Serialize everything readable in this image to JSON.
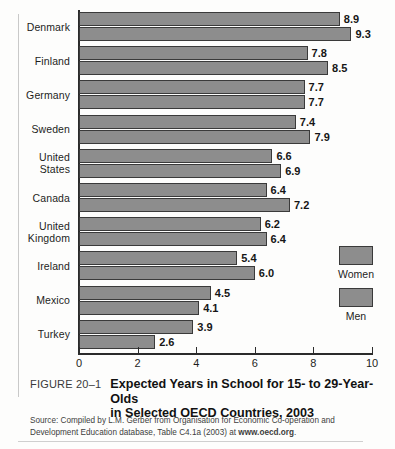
{
  "figure": {
    "number_label": "FIGURE 20–1",
    "title_line1": "Expected Years in School for 15- to 29-Year-Olds",
    "title_line2": "in Selected OECD Countries, 2003",
    "source_line1": "Source: Compiled by L.M. Gerber from Organisation for Economic Co-operation and",
    "source_line2_pre": "Development Education database, Table C4.1a (2003) at ",
    "source_line2_link": "www.oecd.org",
    "source_line2_post": "."
  },
  "legend": {
    "position": "right-inside",
    "items": [
      {
        "label": "Women",
        "color": "#8d8d8d"
      },
      {
        "label": "Men",
        "color": "#8d8d8d"
      }
    ]
  },
  "chart_data": {
    "type": "bar",
    "orientation": "horizontal",
    "title": "Expected Years in School for 15- to 29-Year-Olds in Selected OECD Countries, 2003",
    "subtitle": "",
    "xlabel": "",
    "ylabel": "",
    "xlim": [
      0,
      10
    ],
    "xticks": [
      0,
      2,
      4,
      6,
      8,
      10
    ],
    "xticklabels": [
      "0",
      "2",
      "4",
      "6",
      "8",
      "10"
    ],
    "grid": false,
    "bar_color": "#8d8d8d",
    "bar_edge_color": "#3a3a3a",
    "categories": [
      "Denmark",
      "Finland",
      "Germany",
      "Sweden",
      "United\nStates",
      "Canada",
      "United\nKingdom",
      "Ireland",
      "Mexico",
      "Turkey"
    ],
    "series": [
      {
        "name": "Women",
        "values": [
          8.9,
          7.8,
          7.7,
          7.4,
          6.6,
          6.4,
          6.2,
          5.4,
          4.5,
          3.9
        ],
        "labels": [
          "8.9",
          "7.8",
          "7.7",
          "7.4",
          "6.6",
          "6.4",
          "6.2",
          "5.4",
          "4.5",
          "3.9"
        ]
      },
      {
        "name": "Men",
        "values": [
          9.3,
          8.5,
          7.7,
          7.9,
          6.9,
          7.2,
          6.4,
          6.0,
          4.1,
          2.6
        ],
        "labels": [
          "9.3",
          "8.5",
          "7.7",
          "7.9",
          "6.9",
          "7.2",
          "6.4",
          "6.0",
          "4.1",
          "2.6"
        ]
      }
    ]
  }
}
